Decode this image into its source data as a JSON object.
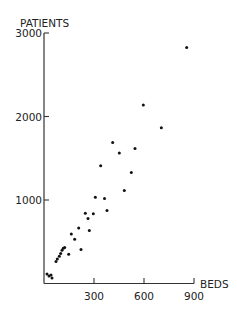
{
  "chart_data": {
    "type": "scatter",
    "title": "",
    "xlabel": "BEDS",
    "ylabel": "PATIENTS",
    "xlim": [
      0,
      900
    ],
    "ylim": [
      0,
      3000
    ],
    "x_ticks": [
      300,
      600,
      900
    ],
    "x_tick_labels": [
      "300",
      "600",
      "900"
    ],
    "y_ticks": [
      1000,
      2000,
      3000
    ],
    "y_tick_labels": [
      "1000",
      "2000",
      "3000"
    ],
    "grid": false,
    "legend": null,
    "series": [
      {
        "name": "hospitals",
        "points": [
          [
            18,
            114
          ],
          [
            30,
            90
          ],
          [
            42,
            102
          ],
          [
            48,
            66
          ],
          [
            72,
            262
          ],
          [
            80,
            294
          ],
          [
            92,
            326
          ],
          [
            100,
            358
          ],
          [
            108,
            398
          ],
          [
            116,
            422
          ],
          [
            124,
            430
          ],
          [
            148,
            350
          ],
          [
            164,
            594
          ],
          [
            184,
            530
          ],
          [
            208,
            666
          ],
          [
            222,
            408
          ],
          [
            248,
            842
          ],
          [
            264,
            778
          ],
          [
            272,
            634
          ],
          [
            296,
            834
          ],
          [
            308,
            1034
          ],
          [
            340,
            1410
          ],
          [
            363,
            1018
          ],
          [
            378,
            874
          ],
          [
            412,
            1690
          ],
          [
            452,
            1562
          ],
          [
            482,
            1114
          ],
          [
            524,
            1330
          ],
          [
            546,
            1618
          ],
          [
            596,
            2138
          ],
          [
            704,
            1866
          ],
          [
            856,
            2826
          ]
        ]
      }
    ]
  },
  "colors": {
    "axis": "#333333",
    "point": "#111111",
    "text": "#222222"
  }
}
